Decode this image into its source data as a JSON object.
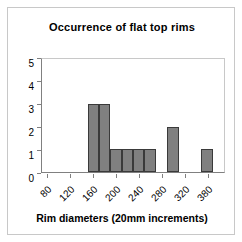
{
  "chart_data": {
    "type": "bar",
    "title": "Occurrence of flat top rims",
    "xlabel": "Rim diameters (20mm increments)",
    "ylabel": "",
    "ylim": [
      0,
      5
    ],
    "ytick_labels": [
      "0",
      "1",
      "2",
      "3",
      "4",
      "5"
    ],
    "ytick_values": [
      0,
      1,
      2,
      3,
      4,
      5
    ],
    "xtick_labels": [
      "80",
      "120",
      "160",
      "200",
      "240",
      "280",
      "320",
      "380"
    ],
    "grid": false,
    "legend": null,
    "bar_color": "#808080",
    "bar_edge_color": "#3a3a3a",
    "axis_color": "#808080",
    "frame_color": "#c8c8c8",
    "categories": [
      "80",
      "100",
      "120",
      "140",
      "160",
      "180",
      "200",
      "220",
      "240",
      "260",
      "280",
      "300",
      "320",
      "340",
      "360",
      "380"
    ],
    "values": [
      0,
      0,
      0,
      0,
      3,
      3,
      1,
      1,
      1,
      1,
      0,
      2,
      0,
      0,
      1,
      0
    ],
    "bars": [
      {
        "category": "80",
        "value": 0
      },
      {
        "category": "100",
        "value": 0
      },
      {
        "category": "120",
        "value": 0
      },
      {
        "category": "140",
        "value": 0
      },
      {
        "category": "160",
        "value": 3
      },
      {
        "category": "180",
        "value": 3
      },
      {
        "category": "200",
        "value": 1
      },
      {
        "category": "220",
        "value": 1
      },
      {
        "category": "240",
        "value": 1
      },
      {
        "category": "260",
        "value": 1
      },
      {
        "category": "280",
        "value": 0
      },
      {
        "category": "300",
        "value": 2
      },
      {
        "category": "320",
        "value": 0
      },
      {
        "category": "340",
        "value": 0
      },
      {
        "category": "360",
        "value": 1
      },
      {
        "category": "380",
        "value": 0
      }
    ]
  }
}
